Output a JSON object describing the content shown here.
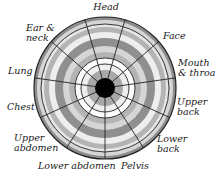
{
  "diagram": {
    "type": "body-region wheel",
    "center": {
      "x": 105,
      "y": 88
    },
    "outer_radius": 71,
    "hub_radius": 10,
    "sector_count": 11,
    "start_angle_deg": 270,
    "colors": {
      "background": "#ffffff",
      "line": "#222222",
      "hub": "#000000",
      "rim": "#8c8c8c",
      "dark_band": "#8f8f8f",
      "mid_band": "#b4b4b4",
      "light_band": "#d6d6d6",
      "pale_band": "#eeeeee",
      "white_band": "#fbfbfb"
    },
    "rings": [
      {
        "r_out": 71,
        "fill": "#8c8c8c"
      },
      {
        "r_out": 68,
        "fill": "#d6d6d6"
      },
      {
        "r_out": 64,
        "fill": "#e6e6e6"
      },
      {
        "r_out": 61,
        "fill": "#b4b4b4"
      },
      {
        "r_out": 56,
        "fill": "#eeeeee"
      },
      {
        "r_out": 50,
        "fill": "#8f8f8f"
      },
      {
        "r_out": 42,
        "fill": "#d6d6d6"
      },
      {
        "r_out": 36,
        "fill": "#b4b4b4"
      },
      {
        "r_out": 30,
        "fill": "#fbfbfb"
      },
      {
        "r_out": 24,
        "fill": "#eeeeee"
      },
      {
        "r_out": 18,
        "fill": "#a8a8a8"
      }
    ],
    "ring_lines": [
      71,
      64,
      30,
      24
    ]
  },
  "labels": {
    "head": "Head",
    "face": "Face",
    "mouth_throat": "Mouth\n& throat",
    "upper_back": "Upper\nback",
    "lower_back": "Lower\nback",
    "pelvis": "Pelvis",
    "lower_abdomen": "Lower abdomen",
    "upper_abdomen": "Upper\nabdomen",
    "chest": "Chest",
    "lung": "Lung",
    "ear_neck": "Ear &\nneck"
  }
}
